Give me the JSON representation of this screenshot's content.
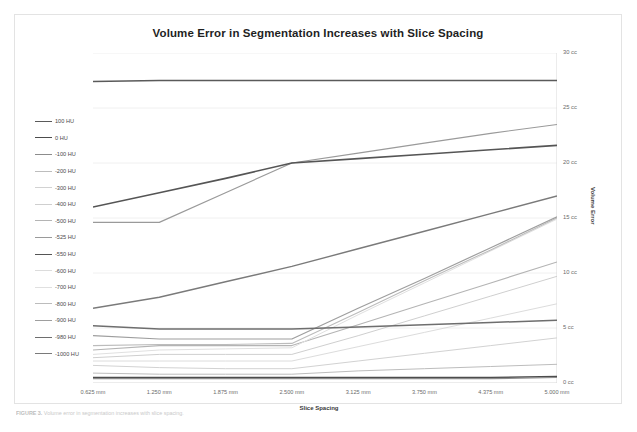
{
  "figure": {
    "caption_prefix": "FIGURE 3.",
    "caption_text": "Volume error in segmentation increases with slice spacing."
  },
  "chart_data": {
    "type": "line",
    "title": "Volume Error in Segmentation Increases with Slice Spacing",
    "xlabel": "Slice Spacing",
    "ylabel": "Volume Error",
    "x": [
      0.625,
      1.25,
      1.875,
      2.5,
      3.125,
      3.75,
      4.375,
      5.0
    ],
    "xticklabels": [
      "0.625 mm",
      "1.250 mm",
      "1.875 mm",
      "2.500 mm",
      "3.125 mm",
      "3.750 mm",
      "4.375 mm",
      "5.000 mm"
    ],
    "yticklabels": [
      "0 cc",
      "5 cc",
      "10 cc",
      "15 cc",
      "20 cc",
      "25 cc",
      "30 cc"
    ],
    "ytickvalues": [
      0,
      5,
      10,
      15,
      20,
      25,
      30
    ],
    "ylim": [
      0,
      30
    ],
    "grid": true,
    "legend_position": "left-outside",
    "series": [
      {
        "name": "100 HU",
        "color": "#5a5a5a",
        "width": 1.5,
        "values": [
          27.4,
          27.5,
          27.5,
          27.5,
          27.5,
          27.5,
          27.5,
          27.5
        ]
      },
      {
        "name": "0 HU",
        "color": "#4c4c4c",
        "width": 1.5,
        "values": [
          0.5,
          0.5,
          0.5,
          0.5,
          0.5,
          0.5,
          0.5,
          0.6
        ]
      },
      {
        "name": "-100 HU",
        "color": "#8c8c8c",
        "width": 1.2,
        "values": [
          0.4,
          0.4,
          0.4,
          0.4,
          0.4,
          0.4,
          0.4,
          0.5
        ]
      },
      {
        "name": "-200 HU",
        "color": "#bdbdbd",
        "width": 1.0,
        "values": [
          0.9,
          0.8,
          0.8,
          0.8,
          1.1,
          1.3,
          1.5,
          1.7
        ]
      },
      {
        "name": "-300 HU",
        "color": "#d2d2d2",
        "width": 1.0,
        "values": [
          1.6,
          1.4,
          1.3,
          1.3,
          2.0,
          2.7,
          3.4,
          4.1
        ]
      },
      {
        "name": "-400 HU",
        "color": "#cfcfcf",
        "width": 1.0,
        "values": [
          2.3,
          2.6,
          2.6,
          2.6,
          4.3,
          6.1,
          7.9,
          9.7
        ]
      },
      {
        "name": "-500 HU",
        "color": "#b4b4b4",
        "width": 1.1,
        "values": [
          3.0,
          3.4,
          3.4,
          3.4,
          5.3,
          7.2,
          9.1,
          11.0
        ]
      },
      {
        "name": "-525 HU",
        "color": "#9a9a9a",
        "width": 1.2,
        "values": [
          14.6,
          14.6,
          17.3,
          20.0,
          20.9,
          21.8,
          22.7,
          23.5
        ]
      },
      {
        "name": "-550 HU",
        "color": "#555555",
        "width": 1.6,
        "values": [
          16.0,
          17.3,
          18.6,
          20.0,
          20.4,
          20.8,
          21.2,
          21.6
        ]
      },
      {
        "name": "-600 HU",
        "color": "#dcdcdc",
        "width": 1.0,
        "values": [
          2.0,
          2.0,
          2.0,
          2.0,
          3.3,
          4.6,
          5.9,
          7.2
        ]
      },
      {
        "name": "-700 HU",
        "color": "#e0e0e0",
        "width": 1.0,
        "values": [
          2.6,
          3.0,
          3.1,
          3.2,
          6.2,
          9.1,
          12.0,
          14.9
        ]
      },
      {
        "name": "-800 HU",
        "color": "#bcbcbc",
        "width": 1.1,
        "values": [
          3.4,
          3.5,
          3.5,
          3.6,
          6.4,
          9.3,
          12.1,
          15.0
        ]
      },
      {
        "name": "-900 HU",
        "color": "#9e9e9e",
        "width": 1.2,
        "values": [
          4.3,
          4.0,
          4.0,
          4.0,
          6.8,
          9.5,
          12.3,
          15.1
        ]
      },
      {
        "name": "-980 HU",
        "color": "#6e6e6e",
        "width": 1.5,
        "values": [
          5.2,
          4.9,
          4.9,
          4.9,
          5.1,
          5.3,
          5.5,
          5.7
        ]
      },
      {
        "name": "-1000 HU",
        "color": "#7a7a7a",
        "width": 1.4,
        "values": [
          6.8,
          7.8,
          9.2,
          10.6,
          12.2,
          13.8,
          15.4,
          17.0
        ]
      }
    ]
  }
}
